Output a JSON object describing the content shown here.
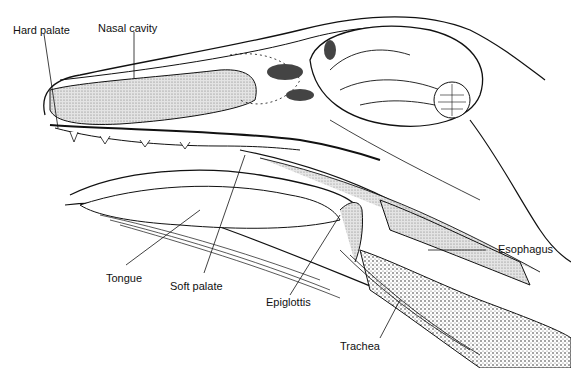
{
  "diagram": {
    "labels": {
      "hard_palate": "Hard palate",
      "nasal_cavity": "Nasal cavity",
      "tongue": "Tongue",
      "soft_palate": "Soft palate",
      "epiglottis": "Epiglottis",
      "trachea": "Trachea",
      "esophagus": "Esophagus"
    },
    "colors": {
      "line": "#111111",
      "shade": "#cfcfcf",
      "background": "#ffffff"
    }
  }
}
